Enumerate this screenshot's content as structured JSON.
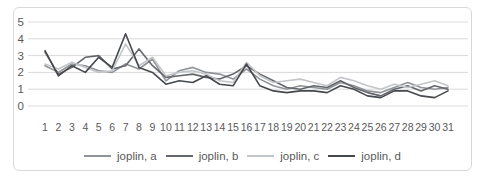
{
  "chart_data": {
    "type": "line",
    "title": "",
    "xlabel": "",
    "ylabel": "",
    "ylim": [
      0,
      5
    ],
    "yticks": [
      0,
      1,
      2,
      3,
      4,
      5
    ],
    "grid": "horizontal",
    "legend_position": "bottom",
    "categories": [
      "1",
      "2",
      "3",
      "4",
      "5",
      "6",
      "7",
      "8",
      "9",
      "10",
      "11",
      "12",
      "13",
      "14",
      "15",
      "16",
      "17",
      "18",
      "19",
      "20",
      "21",
      "22",
      "23",
      "24",
      "25",
      "26",
      "27",
      "28",
      "29",
      "30",
      "31"
    ],
    "series": [
      {
        "name": "joplin, a",
        "color": "#909498",
        "values": [
          2.4,
          2.0,
          2.5,
          2.4,
          2.1,
          2.0,
          2.5,
          2.2,
          2.8,
          1.5,
          2.1,
          2.3,
          2.0,
          1.9,
          1.6,
          2.2,
          1.6,
          1.2,
          1.0,
          1.2,
          1.1,
          1.0,
          1.4,
          1.2,
          0.9,
          0.8,
          1.1,
          1.4,
          1.1,
          1.0,
          1.1
        ]
      },
      {
        "name": "joplin, b",
        "color": "#64676b",
        "values": [
          3.2,
          1.9,
          2.3,
          2.9,
          3.0,
          2.2,
          2.4,
          3.4,
          2.4,
          1.7,
          1.8,
          1.9,
          1.7,
          1.6,
          1.9,
          2.4,
          1.9,
          1.5,
          1.1,
          1.0,
          1.2,
          1.1,
          1.5,
          1.1,
          0.8,
          0.6,
          1.0,
          1.2,
          0.9,
          1.2,
          1.0
        ]
      },
      {
        "name": "joplin, c",
        "color": "#c3c6c9",
        "values": [
          2.5,
          2.2,
          2.6,
          2.3,
          2.0,
          2.1,
          3.7,
          2.4,
          2.9,
          1.8,
          2.0,
          2.1,
          1.9,
          1.5,
          1.4,
          2.6,
          1.8,
          1.4,
          1.5,
          1.6,
          1.4,
          1.2,
          1.7,
          1.5,
          1.2,
          1.0,
          1.3,
          1.1,
          1.3,
          1.5,
          1.2
        ]
      },
      {
        "name": "joplin, d",
        "color": "#46494d",
        "values": [
          3.3,
          1.8,
          2.4,
          2.0,
          2.9,
          2.3,
          4.3,
          2.3,
          2.0,
          1.3,
          1.5,
          1.4,
          1.8,
          1.3,
          1.2,
          2.5,
          1.2,
          0.9,
          0.8,
          0.9,
          0.9,
          0.8,
          1.2,
          1.0,
          0.6,
          0.5,
          0.9,
          0.9,
          0.6,
          0.5,
          0.9
        ]
      }
    ],
    "colors": {
      "grid": "#d9d9d9",
      "tick_label": "#595959",
      "frame_border": "#d9d9d9",
      "background": "#ffffff"
    }
  }
}
